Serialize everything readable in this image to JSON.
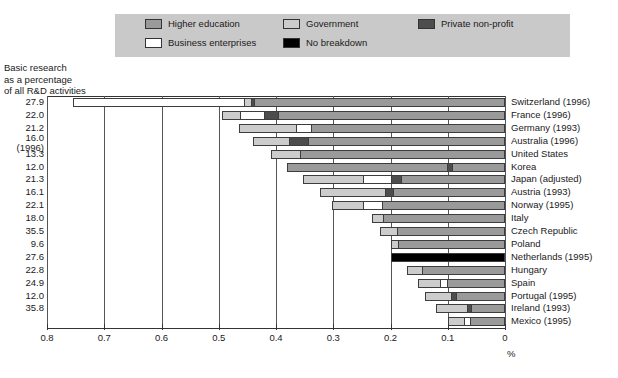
{
  "legend": {
    "items": [
      {
        "label": "Higher education",
        "key": "higher_education",
        "color": "#9a9a9a",
        "col": 1,
        "row": 1
      },
      {
        "label": "Government",
        "key": "government",
        "color": "#cccccc",
        "col": 2,
        "row": 1
      },
      {
        "label": "Private non-profit",
        "key": "private_non_profit",
        "color": "#4d4d4d",
        "col": 3,
        "row": 1
      },
      {
        "label": "Business enterprises",
        "key": "business",
        "color": "#ffffff",
        "col": 1,
        "row": 2
      },
      {
        "label": "No breakdown",
        "key": "no_breakdown",
        "color": "#000000",
        "col": 2,
        "row": 2
      }
    ],
    "background": "#c9c9c9"
  },
  "axis_title": "Basic research\nas a percentage\nof all R&D activities",
  "x_axis": {
    "unit": "%",
    "reversed": true,
    "ticks": [
      "0.8",
      "0.7",
      "0.6",
      "0.5",
      "0.4",
      "0.3",
      "0.2",
      "0.1",
      "0"
    ],
    "tick_values": [
      0.8,
      0.7,
      0.6,
      0.5,
      0.4,
      0.3,
      0.2,
      0.1,
      0.0
    ]
  },
  "chart_data": {
    "type": "bar",
    "orientation": "horizontal-stacked-reversed",
    "title": "",
    "xlabel": "%",
    "ylabel": "",
    "xlim": [
      0.8,
      0.0
    ],
    "grid": true,
    "legend_position": "top",
    "series": [
      {
        "name": "Higher education",
        "key": "higher_education",
        "color": "#9a9a9a"
      },
      {
        "name": "Government",
        "key": "government",
        "color": "#cccccc"
      },
      {
        "name": "Private non-profit",
        "key": "private_non_profit",
        "color": "#4d4d4d"
      },
      {
        "name": "Business enterprises",
        "key": "business",
        "color": "#ffffff"
      },
      {
        "name": "No breakdown",
        "key": "no_breakdown",
        "color": "#000000"
      }
    ],
    "categories": [
      "Switzerland (1996)",
      "France (1996)",
      "Germany (1993)",
      "Australia (1996)",
      "United States",
      "Korea",
      "Japan (adjusted)",
      "Austria (1993)",
      "Norway (1995)",
      "Italy",
      "Czech Republic",
      "Poland",
      "Netherlands (1995)",
      "Hungary",
      "Spain",
      "Portugal (1995)",
      "Ireland (1993)",
      "Mexico (1995)"
    ],
    "percent_of_rd": [
      27.9,
      22.0,
      21.2,
      16.0,
      13.3,
      12.0,
      21.3,
      16.1,
      22.1,
      18.0,
      35.5,
      9.6,
      27.6,
      22.8,
      24.9,
      12.0,
      35.8
    ],
    "rows": [
      {
        "country": "Switzerland (1996)",
        "value_label": "27.9",
        "value_sublabel": "",
        "total": 0.755,
        "segments": [
          {
            "key": "business",
            "color": "#ffffff",
            "value": 0.3
          },
          {
            "key": "government",
            "color": "#cccccc",
            "value": 0.012
          },
          {
            "key": "private_non_profit",
            "color": "#4d4d4d",
            "value": 0.006
          },
          {
            "key": "higher_education",
            "color": "#9a9a9a",
            "value": 0.437
          }
        ]
      },
      {
        "country": "France (1996)",
        "value_label": "22.0",
        "value_sublabel": "",
        "total": 0.495,
        "segments": [
          {
            "key": "government",
            "color": "#cccccc",
            "value": 0.032
          },
          {
            "key": "business",
            "color": "#ffffff",
            "value": 0.042
          },
          {
            "key": "private_non_profit",
            "color": "#4d4d4d",
            "value": 0.026
          },
          {
            "key": "higher_education",
            "color": "#9a9a9a",
            "value": 0.395
          }
        ]
      },
      {
        "country": "Germany (1993)",
        "value_label": "21.2",
        "value_sublabel": "",
        "total": 0.464,
        "segments": [
          {
            "key": "government",
            "color": "#cccccc",
            "value": 0.1
          },
          {
            "key": "business",
            "color": "#ffffff",
            "value": 0.026
          },
          {
            "key": "higher_education",
            "color": "#9a9a9a",
            "value": 0.338
          }
        ]
      },
      {
        "country": "Australia (1996)",
        "value_label": "16.0",
        "value_sublabel": "(1996)",
        "total": 0.44,
        "segments": [
          {
            "key": "government",
            "color": "#cccccc",
            "value": 0.063
          },
          {
            "key": "private_non_profit",
            "color": "#4d4d4d",
            "value": 0.034
          },
          {
            "key": "higher_education",
            "color": "#9a9a9a",
            "value": 0.343
          }
        ]
      },
      {
        "country": "United States",
        "value_label": "13.3",
        "value_sublabel": "",
        "total": 0.408,
        "segments": [
          {
            "key": "government",
            "color": "#cccccc",
            "value": 0.051
          },
          {
            "key": "higher_education",
            "color": "#9a9a9a",
            "value": 0.357
          }
        ]
      },
      {
        "country": "Korea",
        "value_label": "12.0",
        "value_sublabel": "",
        "total": 0.38,
        "segments": [
          {
            "key": "higher_education",
            "color": "#9a9a9a",
            "value": 0.282
          },
          {
            "key": "private_non_profit",
            "color": "#4d4d4d",
            "value": 0.008
          },
          {
            "key": "higher_education",
            "color": "#9a9a9a",
            "value": 0.09
          }
        ]
      },
      {
        "country": "Japan (adjusted)",
        "value_label": "21.3",
        "value_sublabel": "",
        "total": 0.352,
        "segments": [
          {
            "key": "government",
            "color": "#cccccc",
            "value": 0.105
          },
          {
            "key": "business",
            "color": "#ffffff",
            "value": 0.05
          },
          {
            "key": "private_non_profit",
            "color": "#4d4d4d",
            "value": 0.018
          },
          {
            "key": "higher_education",
            "color": "#9a9a9a",
            "value": 0.179
          }
        ]
      },
      {
        "country": "Austria (1993)",
        "value_label": "16.1",
        "value_sublabel": "",
        "total": 0.323,
        "segments": [
          {
            "key": "government",
            "color": "#cccccc",
            "value": 0.115
          },
          {
            "key": "private_non_profit",
            "color": "#4d4d4d",
            "value": 0.013
          },
          {
            "key": "higher_education",
            "color": "#9a9a9a",
            "value": 0.195
          }
        ]
      },
      {
        "country": "Norway (1995)",
        "value_label": "22.1",
        "value_sublabel": "",
        "total": 0.303,
        "segments": [
          {
            "key": "government",
            "color": "#cccccc",
            "value": 0.055
          },
          {
            "key": "business",
            "color": "#ffffff",
            "value": 0.035
          },
          {
            "key": "higher_education",
            "color": "#9a9a9a",
            "value": 0.213
          }
        ]
      },
      {
        "country": "Italy",
        "value_label": "18.0",
        "value_sublabel": "",
        "total": 0.233,
        "segments": [
          {
            "key": "government",
            "color": "#cccccc",
            "value": 0.02
          },
          {
            "key": "higher_education",
            "color": "#9a9a9a",
            "value": 0.213
          }
        ]
      },
      {
        "country": "Czech Republic",
        "value_label": "35.5",
        "value_sublabel": "",
        "total": 0.219,
        "segments": [
          {
            "key": "government",
            "color": "#cccccc",
            "value": 0.03
          },
          {
            "key": "higher_education",
            "color": "#9a9a9a",
            "value": 0.189
          }
        ]
      },
      {
        "country": "Poland",
        "value_label": "9.6",
        "value_sublabel": "",
        "total": 0.2,
        "segments": [
          {
            "key": "government",
            "color": "#cccccc",
            "value": 0.014
          },
          {
            "key": "higher_education",
            "color": "#9a9a9a",
            "value": 0.186
          }
        ]
      },
      {
        "country": "Netherlands (1995)",
        "value_label": "27.6",
        "value_sublabel": "",
        "total": 0.2,
        "segments": [
          {
            "key": "no_breakdown",
            "color": "#000000",
            "value": 0.2
          }
        ]
      },
      {
        "country": "Hungary",
        "value_label": "22.8",
        "value_sublabel": "",
        "total": 0.172,
        "segments": [
          {
            "key": "government",
            "color": "#cccccc",
            "value": 0.027
          },
          {
            "key": "higher_education",
            "color": "#9a9a9a",
            "value": 0.145
          }
        ]
      },
      {
        "country": "Spain",
        "value_label": "24.9",
        "value_sublabel": "",
        "total": 0.152,
        "segments": [
          {
            "key": "government",
            "color": "#cccccc",
            "value": 0.04
          },
          {
            "key": "business",
            "color": "#ffffff",
            "value": 0.012
          },
          {
            "key": "higher_education",
            "color": "#9a9a9a",
            "value": 0.1
          }
        ]
      },
      {
        "country": "Portugal (1995)",
        "value_label": "12.0",
        "value_sublabel": "",
        "total": 0.14,
        "segments": [
          {
            "key": "government",
            "color": "#cccccc",
            "value": 0.046
          },
          {
            "key": "private_non_profit",
            "color": "#4d4d4d",
            "value": 0.009
          },
          {
            "key": "higher_education",
            "color": "#9a9a9a",
            "value": 0.085
          }
        ]
      },
      {
        "country": "Ireland (1993)",
        "value_label": "35.8",
        "value_sublabel": "",
        "total": 0.12,
        "segments": [
          {
            "key": "government",
            "color": "#cccccc",
            "value": 0.055
          },
          {
            "key": "private_non_profit",
            "color": "#4d4d4d",
            "value": 0.007
          },
          {
            "key": "higher_education",
            "color": "#9a9a9a",
            "value": 0.058
          }
        ]
      },
      {
        "country": "Mexico (1995)",
        "value_label": "",
        "value_sublabel": "",
        "total": 0.1,
        "segments": [
          {
            "key": "government",
            "color": "#cccccc",
            "value": 0.03
          },
          {
            "key": "business",
            "color": "#ffffff",
            "value": 0.01
          },
          {
            "key": "higher_education",
            "color": "#9a9a9a",
            "value": 0.06
          }
        ]
      }
    ]
  }
}
